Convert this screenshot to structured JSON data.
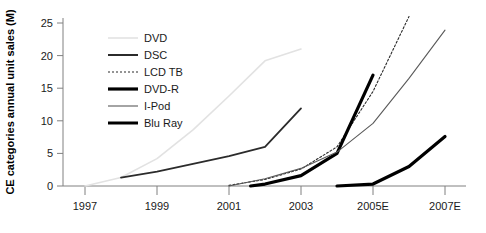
{
  "chart_data": {
    "type": "line",
    "title": "",
    "subtitle": "",
    "xlabel": "",
    "ylabel": "CE categories annual unit sales (M)",
    "xlim": [
      1996.5,
      2007.5
    ],
    "ylim": [
      0,
      26
    ],
    "grid": false,
    "legend_position": "upper-left-inside",
    "x_tick_labels": [
      "1997",
      "1999",
      "2001",
      "2003",
      "2005E",
      "2007E"
    ],
    "x_tick_values": [
      1997,
      1999,
      2001,
      2003,
      2005,
      2007
    ],
    "y_tick_labels": [
      "0",
      "5",
      "10",
      "15",
      "20",
      "25"
    ],
    "y_tick_values": [
      0,
      5,
      10,
      15,
      20,
      25
    ],
    "series": [
      {
        "name": "DVD",
        "color": "#e2e2e2",
        "width": 1.6,
        "dash": "none",
        "x": [
          1997,
          1998,
          1999,
          2000,
          2001,
          2002,
          2003
        ],
        "values": [
          0,
          1.3,
          4.2,
          8.6,
          13.8,
          19.2,
          21.0
        ]
      },
      {
        "name": "DSC",
        "color": "#2b2b2b",
        "width": 1.8,
        "dash": "none",
        "x": [
          1998,
          1999,
          2000,
          2001,
          2002,
          2003
        ],
        "values": [
          1.3,
          2.2,
          3.4,
          4.6,
          6.0,
          11.9
        ]
      },
      {
        "name": "LCD TB",
        "color": "#2b2b2b",
        "width": 1.1,
        "dash": "2,2",
        "x": [
          2001,
          2002,
          2003,
          2004,
          2005,
          2006
        ],
        "values": [
          0.1,
          1.0,
          2.6,
          6.0,
          14.5,
          26.0
        ]
      },
      {
        "name": "DVD-R",
        "color": "#000000",
        "width": 3.2,
        "dash": "none",
        "x": [
          2001.6,
          2002,
          2003,
          2004,
          2005
        ],
        "values": [
          0,
          0.3,
          1.6,
          5.0,
          17.0
        ]
      },
      {
        "name": "I-Pod",
        "color": "#5a5a5a",
        "width": 1.1,
        "dash": "none",
        "x": [
          2001,
          2002,
          2003,
          2004,
          2005,
          2006,
          2007
        ],
        "values": [
          0,
          1.1,
          2.7,
          5.2,
          9.6,
          16.5,
          23.9
        ]
      },
      {
        "name": "Blu Ray",
        "color": "#000000",
        "width": 3.2,
        "dash": "none",
        "x": [
          2004,
          2005,
          2006,
          2007
        ],
        "values": [
          0,
          0.3,
          3.0,
          7.6
        ]
      }
    ],
    "legend_entries": [
      {
        "label": "DVD",
        "color": "#e2e2e2",
        "width": 1.6,
        "dash": "none"
      },
      {
        "label": "DSC",
        "color": "#2b2b2b",
        "width": 2.0,
        "dash": "none"
      },
      {
        "label": "LCD TB",
        "color": "#2b2b2b",
        "width": 1.1,
        "dash": "2,2"
      },
      {
        "label": "DVD-R",
        "color": "#000000",
        "width": 3.2,
        "dash": "none"
      },
      {
        "label": "I-Pod",
        "color": "#5a5a5a",
        "width": 1.1,
        "dash": "none"
      },
      {
        "label": "Blu Ray",
        "color": "#000000",
        "width": 3.0,
        "dash": "none"
      }
    ],
    "axis_color": "#808080"
  }
}
